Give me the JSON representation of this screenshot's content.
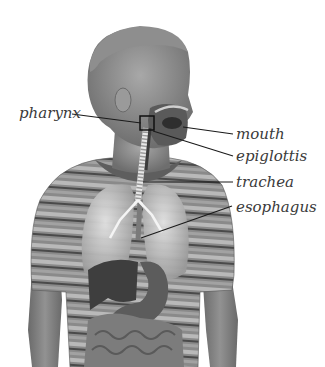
{
  "diagram": {
    "labels": [
      {
        "id": "pharynx",
        "text": "pharynx",
        "x": 19,
        "y": 106
      },
      {
        "id": "mouth",
        "text": "mouth",
        "x": 236,
        "y": 127
      },
      {
        "id": "epiglottis",
        "text": "epiglottis",
        "x": 236,
        "y": 149
      },
      {
        "id": "trachea",
        "text": "trachea",
        "x": 236,
        "y": 175
      },
      {
        "id": "esophagus",
        "text": "esophagus",
        "x": 236,
        "y": 200
      }
    ],
    "colors": {
      "background": "#ffffff",
      "label": "#3a3a3a",
      "leader": "#1a1a1a"
    }
  }
}
